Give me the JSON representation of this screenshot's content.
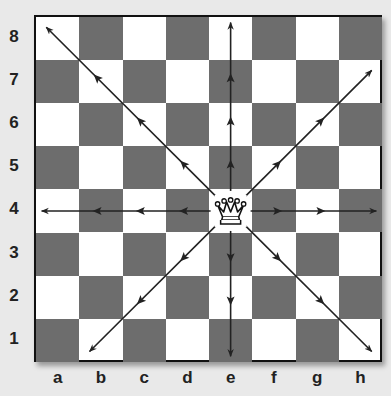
{
  "diagram": {
    "piece": {
      "name": "queen",
      "color": "white",
      "square": "e4"
    },
    "ranks": [
      "8",
      "7",
      "6",
      "5",
      "4",
      "3",
      "2",
      "1"
    ],
    "files": [
      "a",
      "b",
      "c",
      "d",
      "e",
      "f",
      "g",
      "h"
    ],
    "colors": {
      "dark_square": "#6d6d6d",
      "light_square": "#ffffff",
      "arrow": "#222222",
      "background": "#e9e9e9"
    },
    "arrows": [
      {
        "from": "e4",
        "to": "a8",
        "direction": "up-left"
      },
      {
        "from": "e4",
        "to": "e8",
        "direction": "up"
      },
      {
        "from": "e4",
        "to": "h7",
        "direction": "up-right"
      },
      {
        "from": "e4",
        "to": "a4",
        "direction": "left"
      },
      {
        "from": "e4",
        "to": "h4",
        "direction": "right"
      },
      {
        "from": "e4",
        "to": "b1",
        "direction": "down-left"
      },
      {
        "from": "e4",
        "to": "e1",
        "direction": "down"
      },
      {
        "from": "e4",
        "to": "h1",
        "direction": "down-right"
      }
    ]
  }
}
